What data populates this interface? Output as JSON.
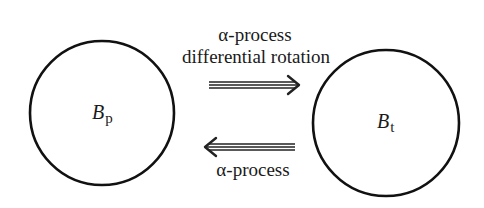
{
  "diagram": {
    "nodes": [
      {
        "id": "poloidal",
        "symbol": "B",
        "subscript": "p",
        "shape": "circle"
      },
      {
        "id": "toroidal",
        "symbol": "B",
        "subscript": "t",
        "shape": "circle"
      }
    ],
    "edges": [
      {
        "from": "poloidal",
        "to": "toroidal",
        "style": "triple-line-arrow",
        "label_line1": "α-process",
        "label_line2": "differential rotation"
      },
      {
        "from": "toroidal",
        "to": "poloidal",
        "style": "triple-line-arrow",
        "label_line1": "α-process"
      }
    ],
    "colors": {
      "stroke": "#111111",
      "background": "#ffffff"
    }
  }
}
